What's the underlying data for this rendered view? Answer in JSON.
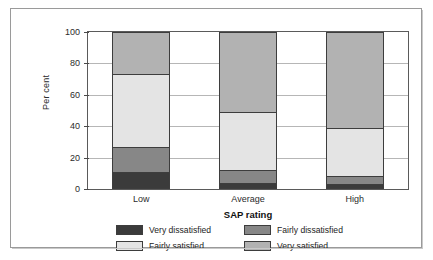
{
  "chart_data": {
    "type": "bar",
    "stacked": true,
    "stacked_mode": "percent",
    "title": "",
    "subtitle": "",
    "xlabel": "SAP rating",
    "ylabel": "Per cent",
    "categories": [
      "Low",
      "Average",
      "High"
    ],
    "ylim": [
      0,
      100
    ],
    "yticks": [
      0,
      20,
      40,
      60,
      80,
      100
    ],
    "ytick_labels": [
      "0",
      "20",
      "40",
      "60",
      "80",
      "100"
    ],
    "grid": "horizontal",
    "legend_position": "bottom",
    "series": [
      {
        "name": "Very dissatisfied",
        "color": "#3b3b3b",
        "values": [
          11,
          4,
          3
        ]
      },
      {
        "name": "Fairly dissatisfied",
        "color": "#878787",
        "values": [
          16,
          8,
          5
        ]
      },
      {
        "name": "Fairly satisfied",
        "color": "#e4e4e4",
        "values": [
          46,
          37,
          31
        ]
      },
      {
        "name": "Very satisfied",
        "color": "#b2b2b2",
        "values": [
          27,
          51,
          61
        ]
      }
    ],
    "annotations": []
  },
  "legend": {
    "items": [
      {
        "label": "Very dissatisfied",
        "color": "#3b3b3b"
      },
      {
        "label": "Fairly dissatisfied",
        "color": "#878787"
      },
      {
        "label": "Fairly satisfied",
        "color": "#e4e4e4"
      },
      {
        "label": "Very satisfied",
        "color": "#b2b2b2"
      }
    ]
  }
}
